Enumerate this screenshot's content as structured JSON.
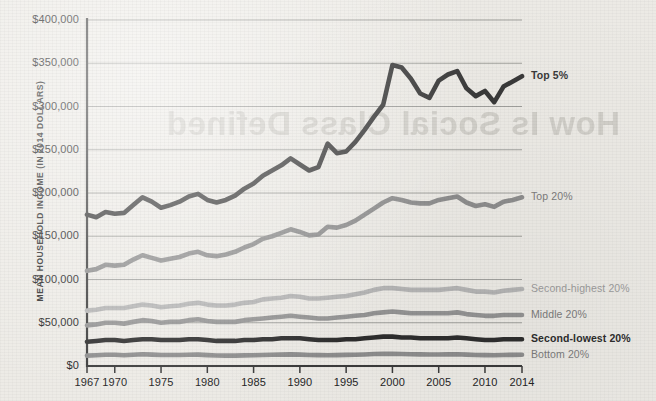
{
  "background": {
    "paper_color": "#edebe6",
    "bleed_through_text": "How Is Social Class Defined"
  },
  "axes": {
    "y_title": "MEAN HOUSEHOLD INCOME (IN 2014 DOLLARS)",
    "y_ticks": [
      "$0",
      "$50,000",
      "$100,000",
      "$150,000",
      "$200,000",
      "$250,000",
      "$300,000",
      "$350,000",
      "$400,000"
    ],
    "x_ticks": [
      "1967",
      "1970",
      "1975",
      "1980",
      "1985",
      "1990",
      "1995",
      "2000",
      "2005",
      "2010",
      "2014"
    ]
  },
  "series_labels": [
    {
      "name": "top-5",
      "text": "Top 5%",
      "color": "#3a3a3a",
      "weight": "700"
    },
    {
      "name": "top-20",
      "text": "Top 20%",
      "color": "#7d7d7d",
      "weight": "400"
    },
    {
      "name": "second-highest-20",
      "text": "Second-highest 20%",
      "color": "#9d9d9d",
      "weight": "400"
    },
    {
      "name": "middle-20",
      "text": "Middle 20%",
      "color": "#7d7d7d",
      "weight": "400"
    },
    {
      "name": "second-lowest-20",
      "text": "Second-lowest 20%",
      "color": "#2e2e2e",
      "weight": "700"
    },
    {
      "name": "bottom-20",
      "text": "Bottom 20%",
      "color": "#7d7d7d",
      "weight": "400"
    }
  ],
  "chart_data": {
    "type": "line",
    "title": "",
    "xlabel": "",
    "ylabel": "MEAN HOUSEHOLD INCOME (IN 2014 DOLLARS)",
    "xlim": [
      1967,
      2014
    ],
    "ylim": [
      0,
      400000
    ],
    "ytick_values": [
      0,
      50000,
      100000,
      150000,
      200000,
      250000,
      300000,
      350000,
      400000
    ],
    "xtick_values": [
      1967,
      1970,
      1975,
      1980,
      1985,
      1990,
      1995,
      2000,
      2005,
      2010,
      2014
    ],
    "grid": "horizontal",
    "legend": "inline-right-of-line-ends",
    "x": [
      1967,
      1968,
      1969,
      1970,
      1971,
      1972,
      1973,
      1974,
      1975,
      1976,
      1977,
      1978,
      1979,
      1980,
      1981,
      1982,
      1983,
      1984,
      1985,
      1986,
      1987,
      1988,
      1989,
      1990,
      1991,
      1992,
      1993,
      1994,
      1995,
      1996,
      1997,
      1998,
      1999,
      2000,
      2001,
      2002,
      2003,
      2004,
      2005,
      2006,
      2007,
      2008,
      2009,
      2010,
      2011,
      2012,
      2013,
      2014
    ],
    "series": [
      {
        "name": "Top 5%",
        "color": "#3a3a3a",
        "width": 4.6,
        "values": [
          175000,
          172000,
          178000,
          176000,
          177000,
          186000,
          195000,
          190000,
          183000,
          186000,
          190000,
          196000,
          199000,
          192000,
          189000,
          192000,
          197000,
          205000,
          211000,
          220000,
          226000,
          232000,
          240000,
          233000,
          226000,
          230000,
          257000,
          246000,
          248000,
          259000,
          273000,
          288000,
          302000,
          348000,
          345000,
          332000,
          315000,
          310000,
          330000,
          337000,
          341000,
          321000,
          312000,
          318000,
          305000,
          323000,
          329000,
          335000
        ]
      },
      {
        "name": "Top 20%",
        "color": "#8e8e8e",
        "width": 4.6,
        "values": [
          110000,
          112000,
          117000,
          116000,
          117000,
          123000,
          128000,
          125000,
          122000,
          124000,
          126000,
          130000,
          132000,
          128000,
          127000,
          129000,
          132000,
          137000,
          141000,
          147000,
          150000,
          154000,
          158000,
          155000,
          151000,
          152000,
          161000,
          160000,
          163000,
          168000,
          175000,
          182000,
          189000,
          194000,
          192000,
          189000,
          188000,
          188000,
          192000,
          194000,
          196000,
          189000,
          185000,
          187000,
          184000,
          190000,
          192000,
          195000
        ]
      },
      {
        "name": "Second-highest 20%",
        "color": "#b5b5b5",
        "width": 4.6,
        "values": [
          64000,
          65000,
          67000,
          67000,
          67000,
          69000,
          71000,
          70000,
          68000,
          69000,
          70000,
          72000,
          73000,
          71000,
          70000,
          70000,
          71000,
          73000,
          74000,
          77000,
          78000,
          79000,
          81000,
          80000,
          78000,
          78000,
          79000,
          80000,
          81000,
          83000,
          85000,
          88000,
          90000,
          90000,
          89000,
          88000,
          88000,
          88000,
          88000,
          89000,
          90000,
          88000,
          86000,
          86000,
          85000,
          87000,
          88000,
          89000
        ]
      },
      {
        "name": "Middle 20%",
        "color": "#949494",
        "width": 4.6,
        "values": [
          47000,
          48000,
          50000,
          50000,
          49000,
          51000,
          53000,
          52000,
          50000,
          51000,
          51000,
          53000,
          54000,
          52000,
          51000,
          51000,
          51000,
          53000,
          54000,
          55000,
          56000,
          57000,
          58000,
          57000,
          56000,
          55000,
          55000,
          56000,
          57000,
          58000,
          59000,
          61000,
          62000,
          63000,
          62000,
          61000,
          61000,
          61000,
          61000,
          61000,
          62000,
          60000,
          59000,
          58000,
          58000,
          59000,
          59000,
          59000
        ]
      },
      {
        "name": "Second-lowest 20%",
        "color": "#2e2e2e",
        "width": 4.6,
        "values": [
          28000,
          29000,
          30000,
          30000,
          29000,
          30000,
          31000,
          31000,
          30000,
          30000,
          30000,
          31000,
          31000,
          30000,
          29000,
          29000,
          29000,
          30000,
          30000,
          31000,
          31000,
          32000,
          32000,
          32000,
          31000,
          30000,
          30000,
          30000,
          31000,
          31000,
          32000,
          33000,
          34000,
          34000,
          33000,
          33000,
          32000,
          32000,
          32000,
          32000,
          33000,
          32000,
          31000,
          30000,
          30000,
          31000,
          31000,
          31000
        ]
      },
      {
        "name": "Bottom 20%",
        "color": "#8e8e8e",
        "width": 4.6,
        "values": [
          12000,
          12500,
          13000,
          13000,
          12500,
          13000,
          13500,
          13200,
          12800,
          12800,
          12800,
          13000,
          13200,
          12600,
          12200,
          12000,
          12000,
          12300,
          12500,
          12800,
          13000,
          13200,
          13400,
          13200,
          12800,
          12600,
          12500,
          12600,
          12900,
          13000,
          13300,
          13800,
          14000,
          14100,
          13800,
          13600,
          13400,
          13300,
          13300,
          13400,
          13500,
          13100,
          12800,
          12600,
          12500,
          12800,
          12900,
          13000
        ]
      }
    ]
  }
}
